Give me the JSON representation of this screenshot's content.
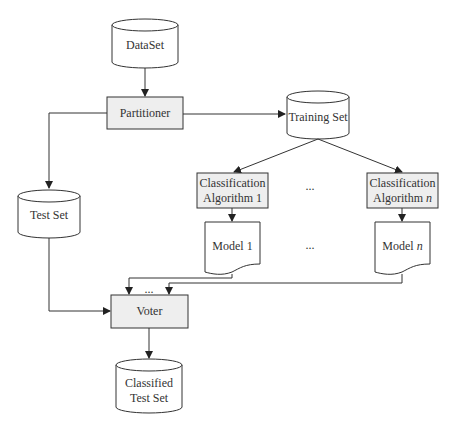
{
  "diagram": {
    "type": "flowchart",
    "nodes": {
      "dataset": {
        "label": "DataSet",
        "shape": "cylinder"
      },
      "partitioner": {
        "label": "Partitioner",
        "shape": "process"
      },
      "training_set": {
        "label": "Training Set",
        "shape": "cylinder"
      },
      "test_set": {
        "label": "Test Set",
        "shape": "cylinder"
      },
      "algo1": {
        "line1": "Classification",
        "line2": "Algorithm 1",
        "shape": "process"
      },
      "algon": {
        "line1": "Classification",
        "line2_prefix": "Algorithm ",
        "line2_var": "n",
        "shape": "process"
      },
      "model1": {
        "label": "Model 1",
        "shape": "document"
      },
      "modeln": {
        "label_prefix": "Model ",
        "label_var": "n",
        "shape": "document"
      },
      "voter": {
        "label": "Voter",
        "shape": "process"
      },
      "classified": {
        "line1": "Classified",
        "line2": "Test Set",
        "shape": "cylinder"
      }
    },
    "ellipsis": {
      "algorithms": "...",
      "models": "...",
      "voter_inputs": "..."
    },
    "edges": [
      [
        "DataSet",
        "Partitioner"
      ],
      [
        "Partitioner",
        "Training Set"
      ],
      [
        "Partitioner",
        "Test Set"
      ],
      [
        "Training Set",
        "Classification Algorithm 1"
      ],
      [
        "Training Set",
        "Classification Algorithm n"
      ],
      [
        "Classification Algorithm 1",
        "Model 1"
      ],
      [
        "Classification Algorithm n",
        "Model n"
      ],
      [
        "Model 1",
        "Voter"
      ],
      [
        "Model n",
        "Voter"
      ],
      [
        "Test Set",
        "Voter"
      ],
      [
        "Voter",
        "Classified Test Set"
      ]
    ],
    "colors": {
      "stroke": "#333333",
      "process_fill": "#eeeeee",
      "storage_fill": "#ffffff"
    }
  }
}
